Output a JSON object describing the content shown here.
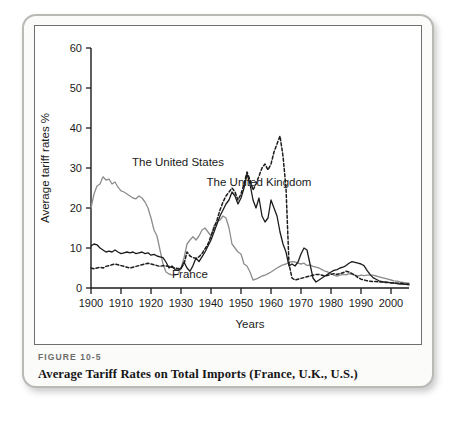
{
  "figure": {
    "number": "FIGURE 10-5",
    "title": "Average Tariff Rates on Total Imports (France, U.K., U.S.)"
  },
  "chart_data": {
    "type": "line",
    "title": "Average Tariff Rates on Total Imports (France, U.K., U.S.)",
    "xlabel": "Years",
    "ylabel": "Average tariff rates %",
    "xlim": [
      1900,
      2006
    ],
    "ylim": [
      0,
      60
    ],
    "yticks": [
      0,
      10,
      20,
      30,
      40,
      50,
      60
    ],
    "xticks": [
      1900,
      1910,
      1920,
      1930,
      1940,
      1950,
      1960,
      1970,
      1980,
      1990,
      2000
    ],
    "grid": false,
    "legend_position": "inline-annotations",
    "annotations": [
      {
        "text": "The United States",
        "x": 1929,
        "y": 30.5
      },
      {
        "text": "The United Kingdom",
        "x": 1956,
        "y": 25.5
      },
      {
        "text": "France",
        "x": 1933,
        "y": 2.6
      }
    ],
    "series": [
      {
        "name": "The United States",
        "style": "solid",
        "color": "#8d8d8b",
        "x": [
          1900,
          1901,
          1902,
          1903,
          1904,
          1905,
          1906,
          1907,
          1908,
          1909,
          1910,
          1911,
          1912,
          1913,
          1914,
          1915,
          1916,
          1917,
          1918,
          1919,
          1920,
          1921,
          1922,
          1923,
          1924,
          1925,
          1926,
          1927,
          1928,
          1929,
          1930,
          1931,
          1932,
          1933,
          1934,
          1935,
          1936,
          1937,
          1938,
          1939,
          1940,
          1941,
          1942,
          1943,
          1944,
          1945,
          1946,
          1947,
          1948,
          1949,
          1950,
          1951,
          1952,
          1953,
          1954,
          1955,
          1956,
          1957,
          1958,
          1959,
          1960,
          1961,
          1962,
          1963,
          1964,
          1965,
          1966,
          1967,
          1968,
          1969,
          1970,
          1971,
          1972,
          1973,
          1974,
          1975,
          1976,
          1977,
          1978,
          1979,
          1980,
          1981,
          1982,
          1983,
          1984,
          1985,
          1986,
          1987,
          1988,
          1989,
          1990,
          1991,
          1992,
          1993,
          1994,
          1995,
          1996,
          1997,
          1998,
          1999,
          2000,
          2001,
          2002,
          2003,
          2004,
          2005,
          2006
        ],
        "y": [
          20.0,
          23.5,
          25.5,
          26.0,
          27.8,
          27.0,
          27.2,
          26.0,
          26.5,
          25.2,
          24.3,
          24.0,
          23.5,
          23.0,
          22.5,
          22.3,
          23.0,
          22.5,
          21.5,
          20.0,
          17.5,
          14.5,
          13.0,
          9.5,
          6.0,
          4.0,
          3.5,
          3.3,
          3.2,
          3.5,
          5.0,
          7.5,
          11.0,
          12.0,
          12.8,
          12.0,
          13.0,
          14.5,
          15.0,
          14.0,
          13.0,
          15.5,
          16.5,
          17.0,
          18.0,
          17.5,
          15.0,
          11.0,
          10.0,
          9.0,
          8.5,
          6.0,
          5.5,
          4.0,
          2.0,
          2.2,
          2.6,
          3.0,
          3.2,
          3.6,
          4.0,
          4.5,
          5.0,
          5.4,
          5.8,
          6.0,
          6.4,
          6.6,
          6.5,
          6.2,
          6.0,
          6.2,
          5.6,
          5.8,
          5.4,
          5.2,
          5.0,
          4.6,
          4.2,
          4.0,
          3.6,
          3.2,
          3.0,
          3.2,
          3.4,
          3.3,
          3.6,
          3.4,
          3.2,
          3.0,
          3.2,
          3.1,
          3.2,
          3.2,
          3.2,
          3.0,
          2.8,
          2.6,
          2.4,
          2.2,
          2.0,
          1.8,
          1.7,
          1.5,
          1.4,
          1.3,
          1.2
        ]
      },
      {
        "name": "France",
        "style": "solid",
        "color": "#1c1c1c",
        "x": [
          1900,
          1901,
          1902,
          1903,
          1904,
          1905,
          1906,
          1907,
          1908,
          1909,
          1910,
          1911,
          1912,
          1913,
          1914,
          1915,
          1916,
          1917,
          1918,
          1919,
          1920,
          1921,
          1922,
          1923,
          1924,
          1925,
          1926,
          1927,
          1928,
          1929,
          1930,
          1931,
          1932,
          1933,
          1934,
          1935,
          1936,
          1937,
          1938,
          1939,
          1940,
          1941,
          1942,
          1943,
          1944,
          1945,
          1946,
          1947,
          1948,
          1949,
          1950,
          1951,
          1952,
          1953,
          1954,
          1955,
          1956,
          1957,
          1958,
          1959,
          1960,
          1961,
          1962,
          1963,
          1964,
          1965,
          1966,
          1967,
          1968,
          1969,
          1970,
          1971,
          1972,
          1973,
          1974,
          1975,
          1976,
          1977,
          1978,
          1979,
          1980,
          1981,
          1982,
          1983,
          1984,
          1985,
          1986,
          1987,
          1988,
          1989,
          1990,
          1991,
          1992,
          1993,
          1994,
          1995,
          1996,
          1997,
          1998,
          1999,
          2000,
          2001,
          2002,
          2003,
          2004,
          2005,
          2006
        ],
        "y": [
          10.5,
          11.0,
          10.8,
          10.0,
          9.5,
          9.0,
          9.2,
          9.0,
          9.5,
          9.0,
          8.6,
          8.8,
          9.0,
          8.8,
          9.0,
          8.6,
          8.8,
          9.0,
          8.6,
          8.8,
          8.2,
          8.4,
          8.0,
          7.8,
          7.6,
          6.5,
          5.0,
          5.5,
          4.6,
          4.4,
          4.8,
          6.5,
          5.0,
          4.2,
          5.6,
          7.5,
          6.6,
          7.8,
          9.0,
          10.5,
          12.0,
          14.0,
          16.0,
          18.0,
          19.5,
          21.0,
          22.0,
          24.0,
          23.0,
          21.0,
          22.5,
          25.0,
          28.5,
          26.0,
          22.0,
          20.0,
          22.5,
          18.0,
          16.5,
          17.5,
          22.0,
          20.0,
          18.0,
          14.0,
          11.0,
          9.0,
          5.5,
          6.0,
          5.5,
          6.5,
          8.5,
          10.0,
          9.5,
          6.0,
          2.5,
          1.5,
          2.0,
          2.5,
          3.0,
          3.5,
          4.0,
          4.4,
          4.6,
          5.0,
          5.2,
          5.6,
          6.2,
          6.6,
          6.4,
          6.2,
          6.0,
          5.6,
          4.4,
          3.4,
          2.6,
          2.2,
          1.8,
          1.6,
          1.5,
          1.4,
          1.3,
          1.2,
          1.1,
          1.0,
          1.0,
          0.9,
          0.8
        ]
      },
      {
        "name": "The United Kingdom",
        "style": "dashed",
        "color": "#1c1c1c",
        "x": [
          1900,
          1901,
          1902,
          1903,
          1904,
          1905,
          1906,
          1907,
          1908,
          1909,
          1910,
          1911,
          1912,
          1913,
          1914,
          1915,
          1916,
          1917,
          1918,
          1919,
          1920,
          1921,
          1922,
          1923,
          1924,
          1925,
          1926,
          1927,
          1928,
          1929,
          1930,
          1931,
          1932,
          1933,
          1934,
          1935,
          1936,
          1937,
          1938,
          1939,
          1940,
          1941,
          1942,
          1943,
          1944,
          1945,
          1946,
          1947,
          1948,
          1949,
          1950,
          1951,
          1952,
          1953,
          1954,
          1955,
          1956,
          1957,
          1958,
          1959,
          1960,
          1961,
          1962,
          1963,
          1964,
          1965,
          1966,
          1967,
          1968,
          1969,
          1970,
          1971,
          1972,
          1973,
          1974,
          1975,
          1976,
          1977,
          1978,
          1979,
          1980,
          1981,
          1982,
          1983,
          1984,
          1985,
          1986,
          1987,
          1988,
          1989,
          1990,
          1991,
          1992,
          1993,
          1994,
          1995,
          1996,
          1997,
          1998,
          1999,
          2000,
          2001,
          2002,
          2003,
          2004,
          2005,
          2006
        ],
        "y": [
          5.0,
          4.8,
          5.0,
          5.2,
          5.0,
          5.4,
          5.6,
          5.8,
          6.0,
          5.8,
          5.6,
          5.4,
          5.2,
          5.0,
          5.2,
          5.4,
          5.6,
          5.8,
          6.0,
          6.2,
          6.0,
          5.8,
          5.6,
          5.4,
          5.6,
          5.5,
          5.4,
          5.2,
          5.0,
          4.8,
          5.0,
          6.0,
          9.0,
          8.0,
          7.6,
          7.4,
          7.8,
          8.6,
          9.8,
          11.0,
          13.0,
          15.0,
          17.0,
          19.5,
          21.5,
          23.0,
          24.0,
          25.0,
          24.0,
          22.0,
          23.5,
          26.0,
          29.0,
          27.0,
          24.5,
          26.0,
          28.0,
          30.0,
          31.0,
          29.5,
          31.0,
          34.0,
          36.0,
          38.0,
          33.0,
          25.0,
          6.0,
          2.5,
          2.0,
          2.2,
          2.4,
          2.6,
          2.8,
          3.0,
          3.2,
          3.4,
          3.4,
          3.2,
          3.0,
          3.2,
          3.4,
          3.6,
          3.4,
          3.6,
          3.8,
          4.2,
          4.0,
          3.6,
          3.2,
          2.6,
          2.2,
          2.0,
          1.8,
          1.7,
          1.6,
          1.6,
          1.5,
          1.5,
          1.4,
          1.4,
          1.3,
          1.3,
          1.2,
          1.2,
          1.1,
          1.0,
          1.0
        ]
      }
    ]
  }
}
